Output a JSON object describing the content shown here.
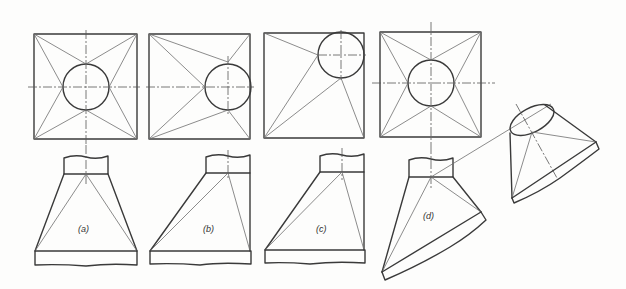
{
  "figure": {
    "type": "engineering-drawing",
    "panels": [
      {
        "id": "a",
        "label": "(a)",
        "description": "Round opening centered over square base"
      },
      {
        "id": "b",
        "label": "(b)",
        "description": "Round opening offset to one side"
      },
      {
        "id": "c",
        "label": "(c)",
        "description": "Round opening in corner of square base"
      },
      {
        "id": "d",
        "label": "(d)",
        "description": "Round opening with oblique (inclined) square base, with auxiliary view"
      }
    ],
    "colors": {
      "line": "#3a3a3a",
      "construction_line": "#6f6f6f",
      "background": "#fdfdfc"
    }
  }
}
